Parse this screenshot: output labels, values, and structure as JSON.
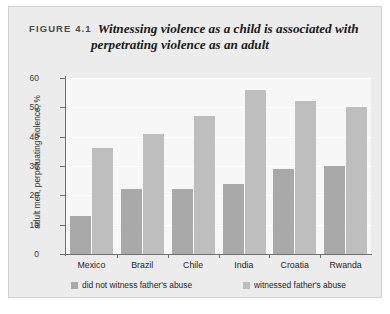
{
  "figure": {
    "number_label": "FIGURE 4.1",
    "title": "Witnessing violence as a child is associated with perpetrating violence as an adult"
  },
  "chart_data": {
    "type": "bar",
    "title": "Witnessing violence as a child is associated with perpetrating violence as an adult",
    "xlabel": "",
    "ylabel": "adult men, perpetuating violence, %",
    "ylim": [
      0,
      60
    ],
    "yticks": [
      0,
      10,
      20,
      30,
      40,
      50,
      60
    ],
    "ytick_labels": [
      "0",
      "10",
      "20",
      "30",
      "40",
      "50",
      "60"
    ],
    "grid": true,
    "legend_position": "bottom",
    "categories": [
      "Mexico",
      "Brazil",
      "Chile",
      "India",
      "Croatia",
      "Rwanda"
    ],
    "series": [
      {
        "name": "did not witness father's abuse",
        "color": "#a9a9a9",
        "values": [
          13,
          22,
          22,
          24,
          29,
          30
        ]
      },
      {
        "name": "witnessed father's abuse",
        "color": "#bebebe",
        "values": [
          36,
          41,
          47,
          56,
          52,
          50
        ]
      }
    ]
  }
}
